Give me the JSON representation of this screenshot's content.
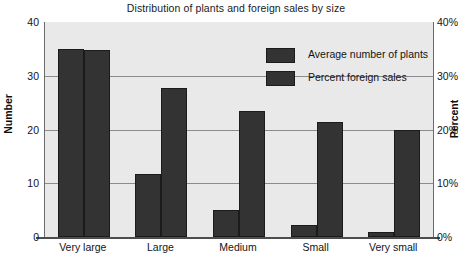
{
  "chart_data": {
    "type": "bar",
    "title": "Distribution of plants and foreign sales by size",
    "xlabel": "",
    "ylabel": "Number",
    "y2label": "Percent",
    "categories": [
      "Very large",
      "Large",
      "Medium",
      "Small",
      "Very small"
    ],
    "series": [
      {
        "name": "Average number of plants",
        "axis": "left",
        "unit": "",
        "values": [
          35.0,
          11.8,
          5.0,
          2.2,
          1.0
        ]
      },
      {
        "name": "Percent foreign sales",
        "axis": "right",
        "unit": "%",
        "values": [
          34.8,
          27.7,
          23.5,
          21.4,
          20.0
        ]
      }
    ],
    "ylim": [
      0,
      40
    ],
    "y2lim": [
      0,
      40
    ],
    "yticks": [
      0,
      10,
      20,
      30,
      40
    ],
    "ytick_labels": [
      "0",
      "10",
      "20",
      "30",
      "40"
    ],
    "y2tick_labels": [
      "0%",
      "10%",
      "20%",
      "30%",
      "40%"
    ],
    "grid": true,
    "gridlines_at": [
      10,
      20,
      30
    ],
    "legend_position": "top-right-inside",
    "bar_color": "#333333",
    "plot_background": "#e9e9e9",
    "page_background": "#ffffff"
  },
  "legend": {
    "entries": [
      {
        "label": "Average number of plants",
        "swatch": "#333333"
      },
      {
        "label": "Percent foreign sales",
        "swatch": "#333333"
      }
    ]
  }
}
